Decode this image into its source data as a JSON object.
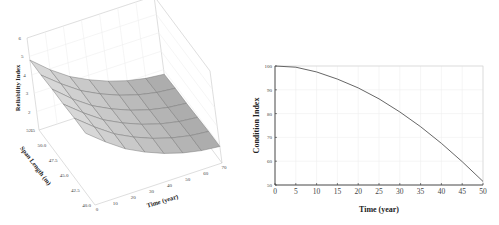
{
  "chart_data": [
    {
      "type": "surface",
      "title": "",
      "xlabel": "Time (year)",
      "ylabel": "Span Length (m)",
      "zlabel": "Reliability Index",
      "x_ticks": [
        "0",
        "10",
        "20",
        "30",
        "40",
        "50",
        "60",
        "70"
      ],
      "y_ticks": [
        "40.0",
        "42.5",
        "45.0",
        "47.5",
        "50.0",
        "52.5"
      ],
      "z_ticks": [
        "1",
        "2",
        "3",
        "4",
        "5",
        "6"
      ],
      "xlim": [
        0,
        70
      ],
      "ylim": [
        40.0,
        52.5
      ],
      "zlim": [
        1,
        6
      ],
      "grid": true,
      "surface_color": "#b8b8b8",
      "description": "Reliability index decreases with time from ~4.9 at year 0 to ~1.8 at year 70; slightly lower for longer spans",
      "x": [
        0,
        10,
        20,
        30,
        40,
        50,
        60,
        70
      ],
      "y": [
        40.0,
        42.5,
        45.0,
        47.5,
        50.0,
        52.5
      ],
      "z": [
        [
          4.9,
          4.1,
          3.4,
          2.9,
          2.5,
          2.2,
          2.0,
          1.9
        ],
        [
          4.9,
          4.1,
          3.4,
          2.9,
          2.5,
          2.2,
          2.0,
          1.9
        ],
        [
          4.85,
          4.05,
          3.35,
          2.85,
          2.45,
          2.15,
          1.95,
          1.85
        ],
        [
          4.85,
          4.0,
          3.3,
          2.8,
          2.4,
          2.1,
          1.9,
          1.8
        ],
        [
          4.8,
          4.0,
          3.3,
          2.8,
          2.4,
          2.1,
          1.9,
          1.8
        ],
        [
          4.8,
          3.95,
          3.25,
          2.75,
          2.35,
          2.05,
          1.85,
          1.75
        ]
      ]
    },
    {
      "type": "line",
      "title": "",
      "xlabel": "Time (year)",
      "ylabel": "Condition Index",
      "x_ticks": [
        "0",
        "5",
        "10",
        "15",
        "20",
        "25",
        "30",
        "35",
        "40",
        "45",
        "50"
      ],
      "y_ticks": [
        "50",
        "60",
        "70",
        "80",
        "90",
        "100"
      ],
      "xlim": [
        0,
        50
      ],
      "ylim": [
        50,
        100
      ],
      "grid": true,
      "legend": null,
      "series": [
        {
          "name": "Condition Index",
          "color": "#555555",
          "x": [
            0,
            5,
            10,
            15,
            20,
            25,
            30,
            35,
            40,
            45,
            50
          ],
          "values": [
            100,
            99.5,
            97.5,
            94.5,
            90.8,
            86.2,
            80.7,
            74.5,
            67.5,
            59.8,
            51.5
          ]
        }
      ]
    }
  ]
}
